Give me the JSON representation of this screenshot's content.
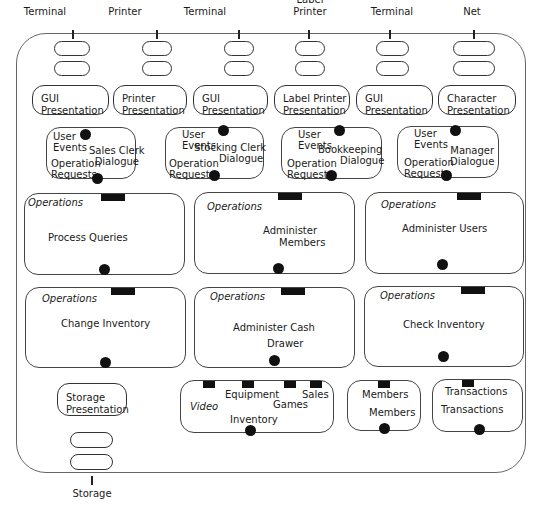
{
  "diagram": {
    "external": [
      {
        "label": "Terminal",
        "x": 40
      },
      {
        "label": "Printer",
        "x": 117
      },
      {
        "label": "Terminal",
        "x": 200
      },
      {
        "label": "Label\nPrinter",
        "x": 270
      },
      {
        "label": "Terminal",
        "x": 352
      },
      {
        "label": "Net",
        "x": 424
      }
    ],
    "external_labels": {
      "e0": "Terminal",
      "e1": "Printer",
      "e2": "Terminal",
      "e3a": "Label",
      "e3b": "Printer",
      "e4": "Terminal",
      "e5": "Net",
      "storage": "Storage"
    },
    "presentations": {
      "p0": {
        "line1": "GUI",
        "line2": "Presentation"
      },
      "p1": {
        "line1": "Printer",
        "line2": "Presentation"
      },
      "p2": {
        "line1": "GUI",
        "line2": "Presentation"
      },
      "p3": {
        "line1": "Label Printer",
        "line2": "Presentation"
      },
      "p4": {
        "line1": "GUI",
        "line2": "Presentation"
      },
      "p5": {
        "line1": "Character",
        "line2": "Presentation"
      },
      "storage": {
        "line1": "Storage",
        "line2": "Presentation"
      }
    },
    "dialogues": {
      "common": {
        "user": "User",
        "events": "Events",
        "operation": "Operation",
        "requests": "Requests"
      },
      "d0": {
        "line1": "Sales Clerk",
        "line2": "Dialogue"
      },
      "d1": {
        "line1": "Stocking Clerk",
        "line2": "Dialogue"
      },
      "d2": {
        "line1": "Bookkeeping",
        "line2": "Dialogue"
      },
      "d3": {
        "line1": "Manager",
        "line2": "Dialogue"
      }
    },
    "operations": {
      "header": "Operations",
      "o0": {
        "line1": "Process Queries",
        "line2": ""
      },
      "o1": {
        "line1": "Administer",
        "line2": "Members"
      },
      "o2": {
        "line1": "Administer Users",
        "line2": ""
      },
      "o3": {
        "line1": "Change Inventory",
        "line2": ""
      },
      "o4": {
        "line1": "Administer Cash",
        "line2": "Drawer"
      },
      "o5": {
        "line1": "Check Inventory",
        "line2": ""
      }
    },
    "data_stores": {
      "inventory": {
        "video": "Video",
        "equipment": "Equipment",
        "games": "Games",
        "sales": "Sales",
        "title": "Inventory"
      },
      "members": {
        "top": "Members",
        "title": "Members"
      },
      "transactions": {
        "top": "Transactions",
        "title": "Transactions"
      }
    }
  }
}
